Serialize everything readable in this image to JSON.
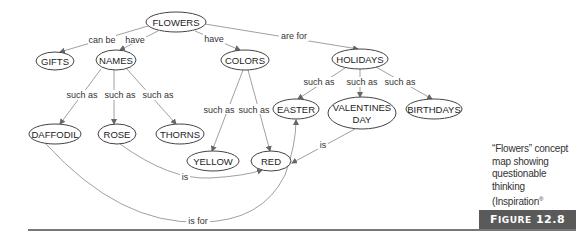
{
  "nodes": {
    "flowers": "FLOWERS",
    "gifts": "GIFTS",
    "names": "NAMES",
    "colors": "COLORS",
    "holidays": "HOLIDAYS",
    "daffodil": "DAFFODIL",
    "rose": "ROSE",
    "thorns": "THORNS",
    "yellow": "YELLOW",
    "red": "RED",
    "easter": "EASTER",
    "valentines_line1": "VALENTINES",
    "valentines_line2": "DAY",
    "birthdays": "BIRTHDAYS"
  },
  "links": {
    "can_be": "can be",
    "have_names": "have",
    "have_colors": "have",
    "are_for": "are for",
    "such_as_daffodil": "such as",
    "such_as_rose": "such as",
    "such_as_thorns": "such as",
    "such_as_yellow": "such as",
    "such_as_red": "such as",
    "such_as_easter": "such as",
    "such_as_valentines": "such as",
    "such_as_birthdays": "such as",
    "rose_is": "is",
    "valentines_is": "is",
    "daffodil_is_for": "is for"
  },
  "caption": {
    "text_before": "“Flowers” concept map showing questionable thinking (Inspiration",
    "registered": "®",
    "text_after": " software)"
  },
  "figure": {
    "prefix_big": "F",
    "prefix_small": "IGURE",
    "number": "12.8"
  }
}
